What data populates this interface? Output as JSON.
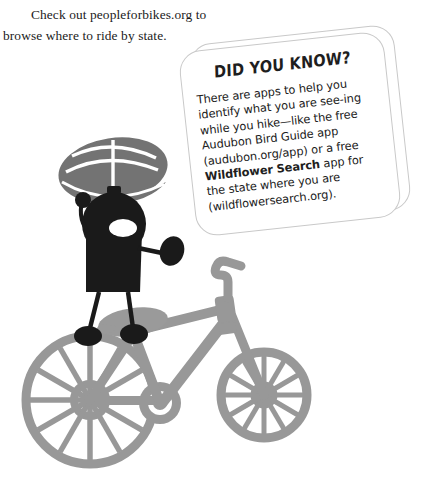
{
  "page": {
    "width": 423,
    "height": 482,
    "background": "#ffffff"
  },
  "intro": {
    "text": "Check out peopleforbikes.org to browse where to ride by state."
  },
  "callout": {
    "title": "DID YOU KNOW?",
    "body_plain": "There are apps to help you identify what you are seeing while you hike—like the free Audubon Bird Guide app (audubon.org/app) or a free Wildflower Search app for the state where you are (wildflowersearch.org).",
    "body_html": "There are apps to help you identify what you are see-ing while you hike—like the free Audubon Bird Guide app (audubon.org/app) or a free <b>Wildflower Search</b> app for the state where you are (wildflowersearch.org).",
    "emphasis": "Wildflower Search",
    "links_mentioned": [
      "audubon.org/app",
      "wildflowersearch.org"
    ],
    "border_color": "#c9c9c9",
    "background": "#ffffff"
  },
  "illustration": {
    "name": "cyclist-with-bicycle",
    "figure": {
      "name": "stick-figure-rider",
      "body_color": "#1a1a1a",
      "helmet_color": "#737373",
      "helmet_highlight": "#ffffff"
    },
    "bicycle": {
      "name": "bicycle-silhouette",
      "color": "#989898",
      "saddle_color": "#9a9a9a",
      "wheels": 2,
      "spokes_per_wheel": 12
    },
    "page_marker_color": "#8c8c8c"
  }
}
